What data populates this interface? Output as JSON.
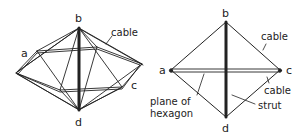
{
  "left_figure": {
    "labels": {
      "a": "a",
      "b": "b",
      "c": "c",
      "d": "d",
      "cable": "cable"
    }
  },
  "right_figure": {
    "labels": {
      "a": "a",
      "b": "b",
      "c": "c",
      "d": "d",
      "cable_top": "cable",
      "cable_bottom": "cable",
      "strut": "strut",
      "plane_line1": "plane of",
      "plane_line2": "hexagon"
    }
  },
  "colors": {
    "ink": "#222222",
    "background": "#ffffff"
  }
}
